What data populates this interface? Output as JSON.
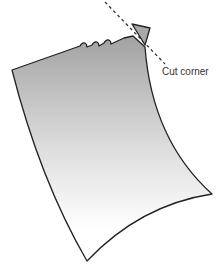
{
  "diagram": {
    "label": "Cut corner",
    "colors": {
      "paper_top": "#a8a8a8",
      "paper_bottom": "#ffffff",
      "outline": "#222222",
      "cut_piece": "#a8a8a8",
      "dashed_line": "#333333"
    }
  }
}
